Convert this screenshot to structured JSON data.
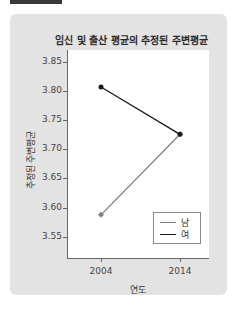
{
  "chart_data": {
    "type": "line",
    "title": "임신 및 출산 평균의 추정된 주변평균",
    "xlabel": "연도",
    "ylabel": "추정된 주변평균",
    "categories": [
      "2004",
      "2014"
    ],
    "ylim": [
      3.54,
      3.87
    ],
    "yticks": [
      "3.85",
      "3.80",
      "3.75",
      "3.70",
      "3.65",
      "3.60",
      "3.55"
    ],
    "series": [
      {
        "name": "남",
        "values": [
          3.588,
          3.726
        ],
        "color": "#808080",
        "marker": "diamond"
      },
      {
        "name": "여",
        "values": [
          3.807,
          3.726
        ],
        "color": "#1a1a1a",
        "marker": "circle"
      }
    ],
    "legend_position": "lower right",
    "grid": false
  },
  "legend": {
    "items": [
      {
        "label": "남"
      },
      {
        "label": "여"
      }
    ]
  }
}
